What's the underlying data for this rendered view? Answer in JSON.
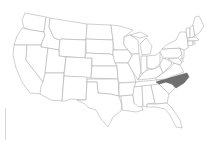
{
  "map": {
    "type": "us-states-outline",
    "highlighted_state": "North Carolina",
    "colors": {
      "background": "#ffffff",
      "state_fill": "#ffffff",
      "state_stroke": "#a8a8a8",
      "highlight_fill": "#6f6f6f"
    },
    "states": [
      {
        "id": "WA",
        "name": "Washington",
        "highlighted": false,
        "points": "25,13 46,17 44,32 31,30 24,28 22,20"
      },
      {
        "id": "OR",
        "name": "Oregon",
        "highlighted": false,
        "points": "22,28 31,30 44,32 45,35 41,45 14,45 17,36"
      },
      {
        "id": "CA",
        "name": "California",
        "highlighted": false,
        "points": "14,45 27,45 26,60 43,82 41,94 30,93 22,82 16,68 13,55"
      },
      {
        "id": "ID",
        "name": "Idaho",
        "highlighted": false,
        "points": "46,17 50,18 49,27 54,38 60,40 59,50 41,47 41,45 45,35 44,32"
      },
      {
        "id": "NV",
        "name": "Nevada",
        "highlighted": false,
        "points": "27,45 41,45 41,47 48,48 45,75 43,82 26,60"
      },
      {
        "id": "MT",
        "name": "Montana",
        "highlighted": false,
        "points": "50,18 87,24 86,40 61,39 60,40 54,38 49,27"
      },
      {
        "id": "WY",
        "name": "Wyoming",
        "highlighted": false,
        "points": "61,39 86,40 85,58 59,56 59,50 60,40"
      },
      {
        "id": "UT",
        "name": "Utah",
        "highlighted": false,
        "points": "48,48 59,50 59,56 66,57 64,73 45,73"
      },
      {
        "id": "AZ",
        "name": "Arizona",
        "highlighted": false,
        "points": "45,73 64,73 62,101 51,100 40,94 41,86 43,82"
      },
      {
        "id": "CO",
        "name": "Colorado",
        "highlighted": false,
        "points": "66,57 92,58 91,78 64,76"
      },
      {
        "id": "NM",
        "name": "New Mexico",
        "highlighted": false,
        "points": "64,76 87,77 86,100 70,99 66,101 62,101"
      },
      {
        "id": "ND",
        "name": "North Dakota",
        "highlighted": false,
        "points": "87,24 111,25 113,40 86,39"
      },
      {
        "id": "SD",
        "name": "South Dakota",
        "highlighted": false,
        "points": "86,39 113,40 113,55 110,54 86,53"
      },
      {
        "id": "NE",
        "name": "Nebraska",
        "highlighted": false,
        "points": "86,53 110,54 113,55 117,66 92,66 92,58 85,58"
      },
      {
        "id": "KS",
        "name": "Kansas",
        "highlighted": false,
        "points": "92,66 117,66 118,79 91,78"
      },
      {
        "id": "OK",
        "name": "Oklahoma",
        "highlighted": false,
        "points": "87,79 118,79 119,96 110,94 98,93 97,82 87,82"
      },
      {
        "id": "TX",
        "name": "Texas",
        "highlighted": false,
        "points": "87,82 97,82 98,93 110,94 119,96 122,106 121,111 113,117 108,127 101,119 96,110 89,108 85,104 77,100 86,100"
      },
      {
        "id": "MN",
        "name": "Minnesota",
        "highlighted": false,
        "points": "111,25 120,26 133,30 124,37 124,45 128,50 114,50 113,40"
      },
      {
        "id": "IA",
        "name": "Iowa",
        "highlighted": false,
        "points": "113,50 128,50 132,56 128,63 115,63 113,55"
      },
      {
        "id": "MO",
        "name": "Missouri",
        "highlighted": false,
        "points": "115,63 128,63 133,72 136,82 119,83 118,79 117,66"
      },
      {
        "id": "AR",
        "name": "Arkansas",
        "highlighted": false,
        "points": "119,83 136,82 133,95 121,96 119,96"
      },
      {
        "id": "LA",
        "name": "Louisiana",
        "highlighted": false,
        "points": "121,96 133,95 134,103 141,104 143,110 136,112 122,110 122,106"
      },
      {
        "id": "WI",
        "name": "Wisconsin",
        "highlighted": false,
        "points": "124,37 130,35 138,40 139,54 132,54 128,50 124,45"
      },
      {
        "id": "IL",
        "name": "Illinois",
        "highlighted": false,
        "points": "132,54 139,54 141,72 138,80 133,72 128,63 132,56"
      },
      {
        "id": "MI",
        "name": "Michigan",
        "highlighted": false,
        "points": "140,44 146,38 152,46 150,54 142,55"
      },
      {
        "id": "MI-UP",
        "name": "Michigan Upper Peninsula",
        "highlighted": false,
        "points": "130,35 140,32 148,36 140,38"
      },
      {
        "id": "IN",
        "name": "Indiana",
        "highlighted": false,
        "points": "141,56 147,56 147,70 142,74 141,72"
      },
      {
        "id": "OH",
        "name": "Ohio",
        "highlighted": false,
        "points": "147,56 156,55 160,52 160,64 154,69 147,68"
      },
      {
        "id": "KY",
        "name": "Kentucky",
        "highlighted": false,
        "points": "138,80 142,74 147,70 154,69 160,66 163,73 156,78 139,80"
      },
      {
        "id": "TN",
        "name": "Tennessee",
        "highlighted": false,
        "points": "136,82 156,80 166,79 160,85 134,87"
      },
      {
        "id": "MS",
        "name": "Mississippi",
        "highlighted": false,
        "points": "134,87 142,86 143,106 139,107 134,103 133,95"
      },
      {
        "id": "AL",
        "name": "Alabama",
        "highlighted": false,
        "points": "142,86 151,85 155,103 147,104 147,107 143,106"
      },
      {
        "id": "GA",
        "name": "Georgia",
        "highlighted": false,
        "points": "151,85 159,84 169,94 167,103 156,104 155,103"
      },
      {
        "id": "FL",
        "name": "Florida",
        "highlighted": false,
        "points": "147,104 156,104 167,103 172,108 180,120 182,128 176,127 170,115 165,109 156,107 147,107"
      },
      {
        "id": "SC",
        "name": "South Carolina",
        "highlighted": false,
        "points": "159,84 166,82 172,84 175,88 169,94"
      },
      {
        "id": "NC",
        "name": "North Carolina",
        "highlighted": true,
        "points": "156,82 165,79 187,73 189,77 184,83 176,88 172,84 166,82 159,84"
      },
      {
        "id": "VA",
        "name": "Virginia",
        "highlighted": false,
        "points": "156,78 163,73 170,68 174,63 180,65 184,72 165,79 156,80"
      },
      {
        "id": "WV",
        "name": "West Virginia",
        "highlighted": false,
        "points": "160,64 163,58 168,60 172,63 168,68 163,73 160,66"
      },
      {
        "id": "PA",
        "name": "Pennsylvania",
        "highlighted": false,
        "points": "160,52 162,49 180,48 182,54 178,58 163,58"
      },
      {
        "id": "MD",
        "name": "Maryland",
        "highlighted": false,
        "points": "168,59 178,58 182,62 180,65 174,63"
      },
      {
        "id": "NJ",
        "name": "New Jersey",
        "highlighted": false,
        "points": "180,48 184,50 184,57 182,60 182,54"
      },
      {
        "id": "DE",
        "name": "Delaware",
        "highlighted": false,
        "points": "181,58 183,59 183,62 181,62"
      },
      {
        "id": "NY",
        "name": "New York",
        "highlighted": false,
        "points": "162,49 168,44 176,40 180,32 186,32 188,44 188,48 184,50 180,48"
      },
      {
        "id": "VT",
        "name": "Vermont",
        "highlighted": false,
        "points": "186,28 190,28 190,38 187,38"
      },
      {
        "id": "NH",
        "name": "New Hampshire",
        "highlighted": false,
        "points": "190,27 193,25 195,36 190,38"
      },
      {
        "id": "ME",
        "name": "Maine",
        "highlighted": false,
        "points": "193,25 195,17 199,16 204,26 200,32 195,36"
      },
      {
        "id": "MA",
        "name": "Massachusetts",
        "highlighted": false,
        "points": "188,38 196,37 199,40 194,41 188,41"
      },
      {
        "id": "CT",
        "name": "Connecticut",
        "highlighted": false,
        "points": "188,41 193,41 193,45 188,46"
      },
      {
        "id": "RI",
        "name": "Rhode Island",
        "highlighted": false,
        "points": "193,41 195,41 195,44 193,44"
      }
    ]
  }
}
